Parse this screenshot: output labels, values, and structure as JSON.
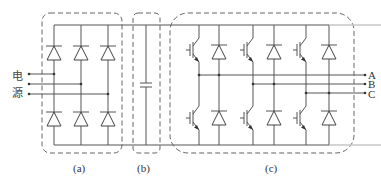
{
  "diagram": {
    "type": "circuit",
    "sections": [
      {
        "id": "a",
        "label": "(a)",
        "role": "three-phase diode bridge rectifier"
      },
      {
        "id": "b",
        "label": "(b)",
        "role": "DC link capacitor"
      },
      {
        "id": "c",
        "label": "(c)",
        "role": "three-phase IGBT inverter with anti-parallel diodes"
      }
    ],
    "input": {
      "label_line1": "电",
      "label_line2": "源"
    },
    "outputs": [
      {
        "label": "A"
      },
      {
        "label": "B"
      },
      {
        "label": "C"
      }
    ],
    "colors": {
      "line": "#555555",
      "dash": "#666666",
      "text": "#333333"
    }
  }
}
